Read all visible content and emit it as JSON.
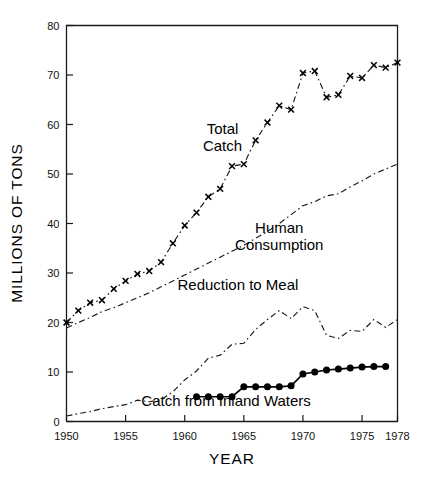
{
  "chart_data": {
    "type": "line",
    "title": "",
    "xlabel": "YEAR",
    "ylabel": "MILLIONS OF TONS",
    "xlim": [
      1950,
      1978
    ],
    "ylim": [
      0,
      80
    ],
    "grid": false,
    "legend_position": "inline-annotations",
    "xticks": [
      1950,
      1955,
      1960,
      1965,
      1970,
      1975,
      1978
    ],
    "xtick_labels": [
      "1950",
      "1955",
      "1960",
      "1965",
      "1970",
      "1975",
      "1978"
    ],
    "yticks": [
      0,
      10,
      20,
      30,
      40,
      50,
      60,
      70,
      80
    ],
    "ytick_labels": [
      "0",
      "10",
      "20",
      "30",
      "40",
      "50",
      "60",
      "70",
      "80"
    ],
    "series": [
      {
        "name": "Total Catch",
        "label": "Total Catch",
        "marker": "x",
        "line_style": "dash-dot",
        "color": "#000000",
        "x": [
          1950,
          1951,
          1952,
          1953,
          1954,
          1955,
          1956,
          1957,
          1958,
          1959,
          1960,
          1961,
          1962,
          1963,
          1964,
          1965,
          1966,
          1967,
          1968,
          1969,
          1970,
          1971,
          1972,
          1973,
          1974,
          1975,
          1976,
          1977,
          1978
        ],
        "values": [
          20.0,
          22.4,
          24.0,
          24.5,
          26.8,
          28.4,
          29.8,
          30.4,
          32.2,
          36.0,
          39.6,
          42.2,
          45.4,
          47.0,
          51.6,
          52.0,
          56.8,
          60.4,
          63.8,
          63.0,
          70.4,
          70.8,
          65.5,
          66.0,
          69.8,
          69.4,
          72.0,
          71.5,
          72.5
        ]
      },
      {
        "name": "Human Consumption",
        "label": "Human Consumption",
        "marker": "none",
        "line_style": "dash-dot",
        "color": "#000000",
        "x": [
          1950,
          1951,
          1952,
          1953,
          1954,
          1955,
          1956,
          1957,
          1958,
          1959,
          1960,
          1961,
          1962,
          1963,
          1964,
          1965,
          1966,
          1967,
          1968,
          1969,
          1970,
          1971,
          1972,
          1973,
          1974,
          1975,
          1976,
          1977,
          1978
        ],
        "values": [
          18.9,
          20.0,
          21.0,
          22.2,
          23.0,
          24.0,
          25.0,
          26.0,
          27.2,
          28.4,
          29.6,
          30.8,
          32.0,
          33.2,
          34.4,
          35.6,
          37.0,
          38.4,
          40.0,
          41.8,
          43.6,
          44.4,
          45.6,
          46.0,
          47.4,
          48.6,
          50.0,
          51.0,
          52.0
        ]
      },
      {
        "name": "Reduction to Meal",
        "label": "Reduction to Meal",
        "marker": "none",
        "line_style": "dash-dot",
        "color": "#000000",
        "x": [
          1950,
          1951,
          1952,
          1953,
          1954,
          1955,
          1956,
          1957,
          1958,
          1959,
          1960,
          1961,
          1962,
          1963,
          1964,
          1965,
          1966,
          1967,
          1968,
          1969,
          1970,
          1971,
          1972,
          1973,
          1974,
          1975,
          1976,
          1977,
          1978
        ],
        "values": [
          1.1,
          1.6,
          2.0,
          2.6,
          3.0,
          3.4,
          4.3,
          4.0,
          4.4,
          6.0,
          8.4,
          10.2,
          12.8,
          13.4,
          15.6,
          15.8,
          18.6,
          20.6,
          22.4,
          20.8,
          23.2,
          22.4,
          17.4,
          16.8,
          18.4,
          18.2,
          20.6,
          19.0,
          20.6
        ]
      },
      {
        "name": "Catch from Inland Waters",
        "label": "Catch from Inland Waters",
        "marker": "dot",
        "line_style": "solid",
        "color": "#000000",
        "x": [
          1961,
          1962,
          1963,
          1964,
          1965,
          1966,
          1967,
          1968,
          1969,
          1970,
          1971,
          1972,
          1973,
          1974,
          1975,
          1976,
          1977
        ],
        "values": [
          5.0,
          5.0,
          5.0,
          5.0,
          7.0,
          7.0,
          7.0,
          7.0,
          7.2,
          9.6,
          10.0,
          10.4,
          10.6,
          10.8,
          11.0,
          11.1,
          11.1
        ]
      }
    ],
    "annotations": [
      {
        "text": "Total Catch",
        "x": 1963.2,
        "y": 58.0,
        "lines": [
          "Total",
          "Catch"
        ]
      },
      {
        "text": "Human Consumption",
        "x": 1968.0,
        "y": 38.0,
        "lines": [
          "Human",
          "Consumption"
        ]
      },
      {
        "text": "Reduction to Meal",
        "x": 1964.5,
        "y": 26.5,
        "lines": [
          "Reduction to Meal"
        ]
      },
      {
        "text": "Catch from Inland Waters",
        "x": 1963.5,
        "y": 3.2,
        "lines": [
          "Catch from Inland Waters"
        ]
      }
    ]
  }
}
